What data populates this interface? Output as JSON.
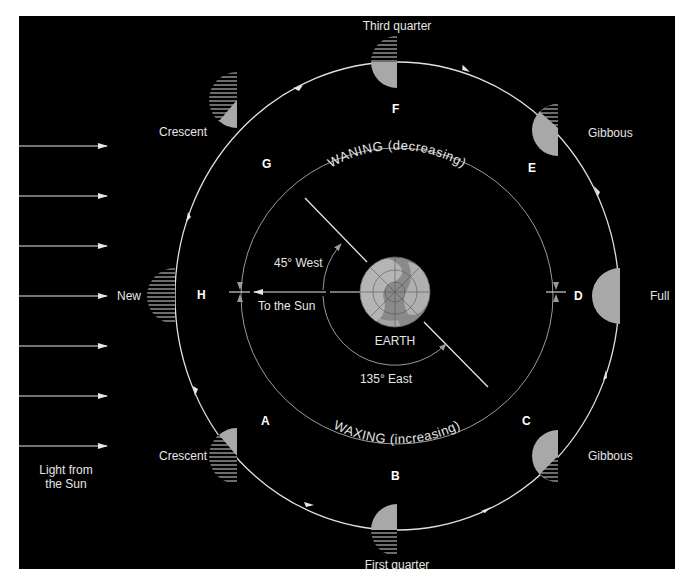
{
  "diagram": {
    "colors": {
      "background": "#000000",
      "page": "#ffffff",
      "orbit": "#e0e0e0",
      "inner_orbit": "#9a9a9a",
      "lit_moon": "#a8a8a8",
      "hatch": "#d8d8d8",
      "text": "#e6e6e6",
      "earth": "#8a8a8a"
    },
    "sunlight": {
      "label_line1": "Light from",
      "label_line2": "the Sun",
      "arrow_count": 7
    },
    "earth": {
      "label": "EARTH"
    },
    "angles": {
      "west": "45° West",
      "east": "135° East",
      "to_sun": "To the Sun"
    },
    "arcs": {
      "waning": "WANING (decreasing)",
      "waxing": "WAXING (increasing)"
    },
    "positions": [
      {
        "letter": "A",
        "phase": "Crescent"
      },
      {
        "letter": "B",
        "phase": "First quarter"
      },
      {
        "letter": "C",
        "phase": "Gibbous"
      },
      {
        "letter": "D",
        "phase": "Full"
      },
      {
        "letter": "E",
        "phase": "Gibbous"
      },
      {
        "letter": "F",
        "phase": "Third quarter"
      },
      {
        "letter": "G",
        "phase": "Crescent"
      },
      {
        "letter": "H",
        "phase": "New"
      }
    ]
  }
}
